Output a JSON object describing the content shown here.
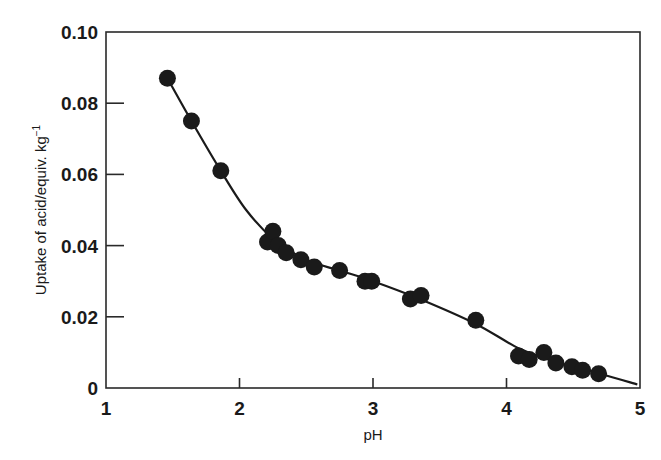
{
  "chart_data": {
    "type": "scatter",
    "title": "",
    "xlabel": "pH",
    "ylabel": "Uptake of acid/equiv. kg",
    "ylabel_superscript": "−1",
    "xlim": [
      1,
      5
    ],
    "ylim": [
      0,
      0.1
    ],
    "grid": false,
    "legend": null,
    "x_ticks": [
      "1",
      "2",
      "3",
      "4",
      "5"
    ],
    "y_ticks": [
      "0",
      "0.02",
      "0.04",
      "0.06",
      "0.08",
      "0.10"
    ],
    "series": [
      {
        "name": "measured uptake",
        "style": "filled-circle",
        "color": "#1a1a1a",
        "points": [
          {
            "x": 1.46,
            "y": 0.087
          },
          {
            "x": 1.64,
            "y": 0.075
          },
          {
            "x": 1.86,
            "y": 0.061
          },
          {
            "x": 2.21,
            "y": 0.041
          },
          {
            "x": 2.25,
            "y": 0.044
          },
          {
            "x": 2.29,
            "y": 0.04
          },
          {
            "x": 2.35,
            "y": 0.038
          },
          {
            "x": 2.46,
            "y": 0.036
          },
          {
            "x": 2.56,
            "y": 0.034
          },
          {
            "x": 2.75,
            "y": 0.033
          },
          {
            "x": 2.94,
            "y": 0.03
          },
          {
            "x": 2.99,
            "y": 0.03
          },
          {
            "x": 3.28,
            "y": 0.025
          },
          {
            "x": 3.36,
            "y": 0.026
          },
          {
            "x": 3.77,
            "y": 0.019
          },
          {
            "x": 4.09,
            "y": 0.009
          },
          {
            "x": 4.17,
            "y": 0.008
          },
          {
            "x": 4.28,
            "y": 0.01
          },
          {
            "x": 4.37,
            "y": 0.007
          },
          {
            "x": 4.49,
            "y": 0.006
          },
          {
            "x": 4.57,
            "y": 0.005
          },
          {
            "x": 4.69,
            "y": 0.004
          }
        ]
      },
      {
        "name": "fitted curve",
        "style": "line",
        "color": "#1a1a1a",
        "points": [
          {
            "x": 1.46,
            "y": 0.087
          },
          {
            "x": 1.64,
            "y": 0.075
          },
          {
            "x": 1.86,
            "y": 0.061
          },
          {
            "x": 2.05,
            "y": 0.05
          },
          {
            "x": 2.25,
            "y": 0.042
          },
          {
            "x": 2.5,
            "y": 0.036
          },
          {
            "x": 2.75,
            "y": 0.033
          },
          {
            "x": 3.0,
            "y": 0.03
          },
          {
            "x": 3.35,
            "y": 0.025
          },
          {
            "x": 3.77,
            "y": 0.018
          },
          {
            "x": 4.1,
            "y": 0.011
          },
          {
            "x": 4.4,
            "y": 0.007
          },
          {
            "x": 4.7,
            "y": 0.004
          },
          {
            "x": 4.98,
            "y": 0.001
          }
        ]
      }
    ]
  }
}
